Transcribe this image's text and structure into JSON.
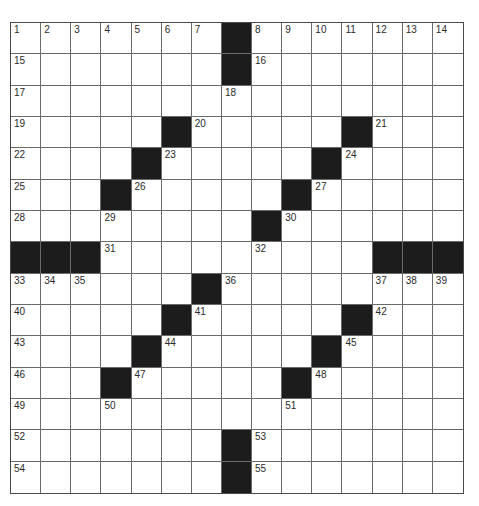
{
  "puzzle": {
    "rows": 15,
    "cols": 15,
    "colors": {
      "block": "#1c1c1c",
      "cell": "#ffffff",
      "gridline": "#6a6a6a",
      "number": "#2a2a2a"
    },
    "layout": [
      "1234567#89ABCDE",
      ".......#.......",
      ".......x.......",
      ".....#.....#...",
      "....#.....#....",
      "...#.....#.....",
      "...x....#......",
      "###x....x...###",
      "xxx...#x....xxx",
      ".....#x....#x..",
      "....#x....#x...",
      "...#x....#x....",
      "...x.....x.....",
      ".......#x......",
      ".......#x......"
    ],
    "blocks": [
      [
        0,
        7
      ],
      [
        1,
        7
      ],
      [
        3,
        5
      ],
      [
        3,
        11
      ],
      [
        4,
        4
      ],
      [
        4,
        10
      ],
      [
        5,
        3
      ],
      [
        5,
        9
      ],
      [
        6,
        8
      ],
      [
        7,
        0
      ],
      [
        7,
        1
      ],
      [
        7,
        2
      ],
      [
        7,
        12
      ],
      [
        7,
        13
      ],
      [
        7,
        14
      ],
      [
        8,
        6
      ],
      [
        9,
        5
      ],
      [
        9,
        11
      ],
      [
        10,
        4
      ],
      [
        10,
        10
      ],
      [
        11,
        3
      ],
      [
        11,
        9
      ],
      [
        13,
        7
      ],
      [
        14,
        7
      ]
    ],
    "numbers": [
      {
        "r": 0,
        "c": 0,
        "n": "1"
      },
      {
        "r": 0,
        "c": 1,
        "n": "2"
      },
      {
        "r": 0,
        "c": 2,
        "n": "3"
      },
      {
        "r": 0,
        "c": 3,
        "n": "4"
      },
      {
        "r": 0,
        "c": 4,
        "n": "5"
      },
      {
        "r": 0,
        "c": 5,
        "n": "6"
      },
      {
        "r": 0,
        "c": 6,
        "n": "7"
      },
      {
        "r": 0,
        "c": 8,
        "n": "8"
      },
      {
        "r": 0,
        "c": 9,
        "n": "9"
      },
      {
        "r": 0,
        "c": 10,
        "n": "10"
      },
      {
        "r": 0,
        "c": 11,
        "n": "11"
      },
      {
        "r": 0,
        "c": 12,
        "n": "12"
      },
      {
        "r": 0,
        "c": 13,
        "n": "13"
      },
      {
        "r": 0,
        "c": 14,
        "n": "14"
      },
      {
        "r": 1,
        "c": 0,
        "n": "15"
      },
      {
        "r": 1,
        "c": 8,
        "n": "16"
      },
      {
        "r": 2,
        "c": 0,
        "n": "17"
      },
      {
        "r": 2,
        "c": 7,
        "n": "18"
      },
      {
        "r": 3,
        "c": 0,
        "n": "19"
      },
      {
        "r": 3,
        "c": 6,
        "n": "20"
      },
      {
        "r": 3,
        "c": 12,
        "n": "21"
      },
      {
        "r": 4,
        "c": 0,
        "n": "22"
      },
      {
        "r": 4,
        "c": 5,
        "n": "23"
      },
      {
        "r": 4,
        "c": 11,
        "n": "24"
      },
      {
        "r": 5,
        "c": 0,
        "n": "25"
      },
      {
        "r": 5,
        "c": 4,
        "n": "26"
      },
      {
        "r": 5,
        "c": 10,
        "n": "27"
      },
      {
        "r": 6,
        "c": 0,
        "n": "28"
      },
      {
        "r": 6,
        "c": 3,
        "n": "29"
      },
      {
        "r": 6,
        "c": 9,
        "n": "30"
      },
      {
        "r": 7,
        "c": 3,
        "n": "31"
      },
      {
        "r": 7,
        "c": 8,
        "n": "32"
      },
      {
        "r": 8,
        "c": 0,
        "n": "33"
      },
      {
        "r": 8,
        "c": 1,
        "n": "34"
      },
      {
        "r": 8,
        "c": 2,
        "n": "35"
      },
      {
        "r": 8,
        "c": 7,
        "n": "36"
      },
      {
        "r": 8,
        "c": 12,
        "n": "37"
      },
      {
        "r": 8,
        "c": 13,
        "n": "38"
      },
      {
        "r": 8,
        "c": 14,
        "n": "39"
      },
      {
        "r": 9,
        "c": 0,
        "n": "40"
      },
      {
        "r": 9,
        "c": 6,
        "n": "41"
      },
      {
        "r": 9,
        "c": 12,
        "n": "42"
      },
      {
        "r": 10,
        "c": 0,
        "n": "43"
      },
      {
        "r": 10,
        "c": 5,
        "n": "44"
      },
      {
        "r": 10,
        "c": 11,
        "n": "45"
      },
      {
        "r": 11,
        "c": 0,
        "n": "46"
      },
      {
        "r": 11,
        "c": 4,
        "n": "47"
      },
      {
        "r": 11,
        "c": 10,
        "n": "48"
      },
      {
        "r": 12,
        "c": 0,
        "n": "49"
      },
      {
        "r": 12,
        "c": 3,
        "n": "50"
      },
      {
        "r": 12,
        "c": 9,
        "n": "51"
      },
      {
        "r": 13,
        "c": 0,
        "n": "52"
      },
      {
        "r": 13,
        "c": 8,
        "n": "53"
      },
      {
        "r": 14,
        "c": 0,
        "n": "54"
      },
      {
        "r": 14,
        "c": 8,
        "n": "55"
      }
    ],
    "entries": []
  }
}
